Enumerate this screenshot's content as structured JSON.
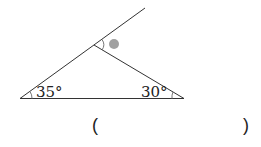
{
  "diagram": {
    "type": "triangle-exterior-angle",
    "angles": {
      "left": "35°",
      "right": "30°",
      "exterior_marker": "●"
    },
    "colors": {
      "line": "#333333",
      "marker": "#a0a0a0"
    }
  },
  "answer": {
    "open_paren": "(",
    "close_paren": ")",
    "value": ""
  }
}
